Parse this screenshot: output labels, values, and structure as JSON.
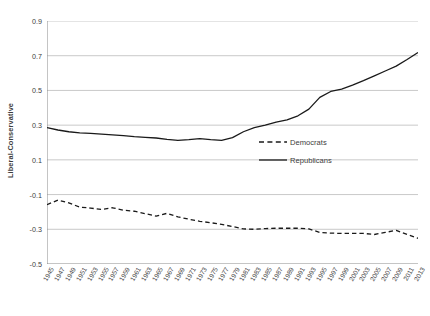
{
  "chart_data": {
    "type": "line",
    "title": "",
    "xlabel": "",
    "ylabel": "Liberal-Conservative",
    "ylim": [
      -0.5,
      0.9
    ],
    "yticks": [
      -0.5,
      -0.3,
      -0.1,
      0.1,
      0.3,
      0.5,
      0.7,
      0.9
    ],
    "ytick_labels": [
      "-0.5",
      "-0.3",
      "-0.1",
      "0.1",
      "0.3",
      "0.5",
      "0.7",
      "0.9"
    ],
    "grid": "horizontal",
    "legend_position": "center-right-inside",
    "x": [
      1945,
      1947,
      1949,
      1951,
      1953,
      1955,
      1957,
      1959,
      1961,
      1963,
      1965,
      1967,
      1969,
      1971,
      1973,
      1975,
      1977,
      1979,
      1981,
      1983,
      1985,
      1987,
      1989,
      1991,
      1993,
      1995,
      1997,
      1999,
      2001,
      2003,
      2005,
      2007,
      2009,
      2011,
      2013
    ],
    "categories": [
      "1945",
      "1947",
      "1949",
      "1951",
      "1953",
      "1955",
      "1957",
      "1959",
      "1961",
      "1963",
      "1965",
      "1967",
      "1969",
      "1971",
      "1973",
      "1975",
      "1977",
      "1979",
      "1981",
      "1983",
      "1985",
      "1987",
      "1989",
      "1991",
      "1993",
      "1995",
      "1997",
      "1999",
      "2001",
      "2003",
      "2005",
      "2007",
      "2009",
      "2011",
      "2013"
    ],
    "series": [
      {
        "name": "Democrats",
        "style": "dashed",
        "color": "#1a1a1a",
        "values": [
          -0.158,
          -0.132,
          -0.148,
          -0.172,
          -0.178,
          -0.186,
          -0.176,
          -0.19,
          -0.196,
          -0.21,
          -0.224,
          -0.208,
          -0.228,
          -0.242,
          -0.254,
          -0.262,
          -0.272,
          -0.284,
          -0.298,
          -0.3,
          -0.296,
          -0.294,
          -0.294,
          -0.294,
          -0.298,
          -0.318,
          -0.322,
          -0.324,
          -0.324,
          -0.324,
          -0.33,
          -0.318,
          -0.306,
          -0.33,
          -0.352
        ]
      },
      {
        "name": "Republicans",
        "style": "solid",
        "color": "#1a1a1a",
        "values": [
          0.286,
          0.272,
          0.262,
          0.256,
          0.252,
          0.248,
          0.244,
          0.24,
          0.234,
          0.23,
          0.226,
          0.218,
          0.212,
          0.216,
          0.222,
          0.216,
          0.212,
          0.228,
          0.262,
          0.286,
          0.3,
          0.318,
          0.33,
          0.354,
          0.392,
          0.46,
          0.494,
          0.508,
          0.53,
          0.556,
          0.584,
          0.612,
          0.64,
          0.678,
          0.718
        ]
      }
    ]
  },
  "legend": {
    "items": [
      {
        "label": "Democrats",
        "style": "dashed"
      },
      {
        "label": "Republicans",
        "style": "solid"
      }
    ]
  },
  "colors": {
    "line": "#1a1a1a",
    "grid": "#c9c9c9",
    "axis": "#808080",
    "text": "#3d3d3d"
  }
}
